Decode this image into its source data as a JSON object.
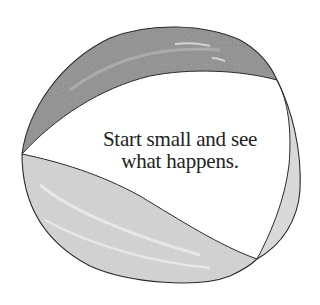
{
  "illustration": {
    "subject": "beach-ball",
    "colors": {
      "background": "#ffffff",
      "outline": "#2b2b2b",
      "top_stripe": "#8e8e8e",
      "top_stripe_highlight": "#b8b8b8",
      "bottom_stripe": "#d4d4d4",
      "bottom_stripe_highlight": "#e8e8e8",
      "right_stripe": "#d9d9d9",
      "center_panel": "#ffffff",
      "text": "#222222"
    }
  },
  "caption": {
    "line1": "Start small and see",
    "line2": "what happens."
  }
}
